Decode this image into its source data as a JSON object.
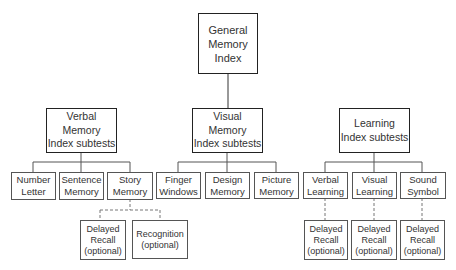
{
  "root": {
    "label": "General\nMemory\nIndex"
  },
  "indexes": [
    {
      "label": "Verbal\nMemory\nIndex subtests",
      "subtests": [
        {
          "label": "Number\nLetter"
        },
        {
          "label": "Sentence\nMemory"
        },
        {
          "label": "Story\nMemory"
        }
      ],
      "optional": [
        {
          "label": "Delayed\nRecall\n(optional)"
        },
        {
          "label": "Recognition\n(optional)"
        }
      ]
    },
    {
      "label": "Visual\nMemory\nIndex subtests",
      "subtests": [
        {
          "label": "Finger\nWindows"
        },
        {
          "label": "Design\nMemory"
        },
        {
          "label": "Picture\nMemory"
        }
      ]
    },
    {
      "label": "Learning\nIndex subtests",
      "subtests": [
        {
          "label": "Verbal\nLearning"
        },
        {
          "label": "Visual\nLearning"
        },
        {
          "label": "Sound\nSymbol"
        }
      ],
      "optional": [
        {
          "label": "Delayed\nRecall\n(optional)"
        },
        {
          "label": "Delayed\nRecall\n(optional)"
        },
        {
          "label": "Delayed\nRecall\n(optional)"
        }
      ]
    }
  ],
  "colors": {
    "line": "#222222",
    "thin_line": "#555555",
    "dashed_line": "#777777",
    "text": "#333333"
  }
}
